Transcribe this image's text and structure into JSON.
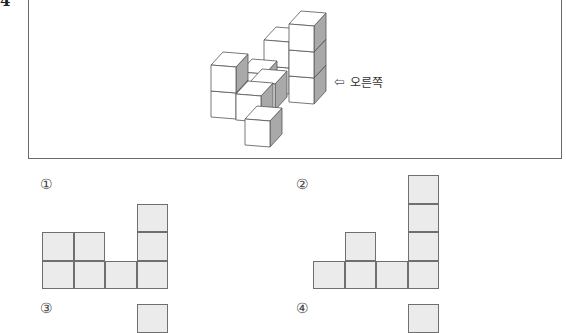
{
  "question": {
    "number": "4"
  },
  "figure": {
    "direction_label": "오른쪽",
    "direction_arrow": "⇦",
    "face_colors": {
      "front": "#ffffff",
      "top": "#ffffff",
      "side": "#a9a9a9",
      "stroke": "#555555"
    }
  },
  "options": [
    {
      "label": "①",
      "column_heights": [
        2,
        2,
        1,
        3
      ]
    },
    {
      "label": "②",
      "column_heights": [
        1,
        2,
        1,
        4
      ]
    },
    {
      "label": "③",
      "column_heights_visible": [
        0,
        0,
        0,
        1
      ]
    },
    {
      "label": "④",
      "column_heights_visible": [
        0,
        0,
        0,
        1
      ]
    }
  ],
  "colors": {
    "cell_fill": "#ebebeb",
    "cell_border": "#6f6f6f",
    "frame_border": "#6a6a6a"
  }
}
